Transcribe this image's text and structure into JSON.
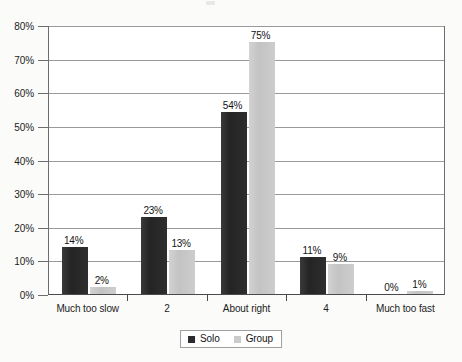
{
  "chart_data": {
    "type": "bar",
    "title": "",
    "subtitle": "",
    "xlabel": "",
    "ylabel": "",
    "categories": [
      "Much too slow",
      "2",
      "About right",
      "4",
      "Much too fast"
    ],
    "series": [
      {
        "name": "Solo",
        "color": "#2b2b2b",
        "values": [
          14,
          23,
          54,
          11,
          0
        ],
        "labels": [
          "14%",
          "23%",
          "54%",
          "11%",
          "0%"
        ]
      },
      {
        "name": "Group",
        "color": "#c9c9c9",
        "values": [
          2,
          13,
          75,
          9,
          1
        ],
        "labels": [
          "2%",
          "13%",
          "75%",
          "9%",
          "1%"
        ]
      }
    ],
    "ylim": [
      0,
      80
    ],
    "ytick_step": 10,
    "ytick_labels": [
      "0%",
      "10%",
      "20%",
      "30%",
      "40%",
      "50%",
      "60%",
      "70%",
      "80%"
    ],
    "ytick_values": [
      0,
      10,
      20,
      30,
      40,
      50,
      60,
      70,
      80
    ],
    "grid": true,
    "grid_axis": "y",
    "legend": true,
    "legend_position": "bottom",
    "value_labels": true,
    "background_color": "#fbfbf9",
    "plot_background_color": "#ffffff",
    "axis_color": "#4a4a4a",
    "grid_color": "#9a9a9a"
  },
  "legend": {
    "entries": [
      {
        "label": "Solo",
        "swatch": "solo-swatch"
      },
      {
        "label": "Group",
        "swatch": "group-swatch"
      }
    ]
  }
}
